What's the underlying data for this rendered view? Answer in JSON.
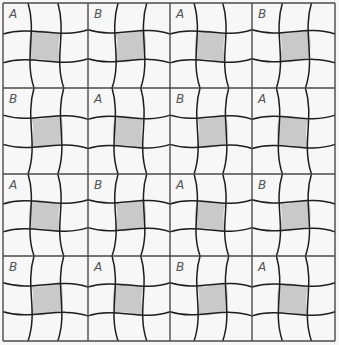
{
  "figure": {
    "colors": {
      "background": "#f7f7f7",
      "line": "#1e1e1e",
      "frame": "#4a4a4a",
      "shade": "#c9c9c9",
      "label": "#555555"
    },
    "grid": {
      "cols_x": [
        3,
        88,
        170,
        252,
        335
      ],
      "rows_y": [
        3,
        88,
        174,
        256,
        341
      ]
    },
    "tiles": [
      [
        {
          "label": "A"
        },
        {
          "label": "B"
        },
        {
          "label": "A"
        },
        {
          "label": "B"
        }
      ],
      [
        {
          "label": "B"
        },
        {
          "label": "A"
        },
        {
          "label": "B"
        },
        {
          "label": "A"
        }
      ],
      [
        {
          "label": "A"
        },
        {
          "label": "B"
        },
        {
          "label": "A"
        },
        {
          "label": "B"
        }
      ],
      [
        {
          "label": "B"
        },
        {
          "label": "A"
        },
        {
          "label": "B"
        },
        {
          "label": "A"
        }
      ]
    ]
  }
}
